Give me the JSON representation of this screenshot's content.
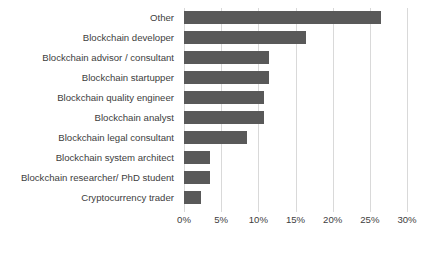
{
  "chart_data": {
    "type": "bar",
    "orientation": "horizontal",
    "title": "",
    "xlabel": "",
    "ylabel": "",
    "categories": [
      "Other",
      "Blockchain developer",
      "Blockchain advisor / consultant",
      "Blockchain startupper",
      "Blockchain quality engineer",
      "Blockchain analyst",
      "Blockchain legal consultant",
      "Blockchain system architect",
      "Blockchain researcher/ PhD student",
      "Cryptocurrency trader"
    ],
    "values": [
      26.5,
      16.4,
      11.5,
      11.5,
      10.8,
      10.8,
      8.5,
      3.5,
      3.5,
      2.3
    ],
    "xlim": [
      0,
      30
    ],
    "xticks": [
      0,
      5,
      10,
      15,
      20,
      25,
      30
    ],
    "xtick_labels": [
      "0%",
      "5%",
      "10%",
      "15%",
      "20%",
      "25%",
      "30%"
    ],
    "grid": true,
    "legend": false,
    "bar_color": "#595959",
    "gridline_color": "#d9d9d9",
    "text_color": "#404040",
    "background": "#ffffff"
  }
}
